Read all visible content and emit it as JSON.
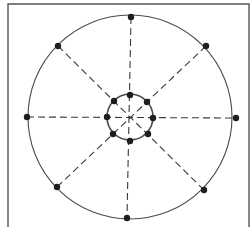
{
  "diagram": {
    "type": "two-concentric-ring network with radial spokes",
    "colors": {
      "background": "#ffffff",
      "frame": "#555555",
      "ring": "#4a4a4a",
      "spoke": "#3a3a3a",
      "node": "#1e1e1e"
    },
    "frame": {
      "x": 8,
      "y": 4,
      "width": 241,
      "height": 223
    },
    "center": {
      "x": 130,
      "y": 117
    },
    "outer_ring": {
      "radius": 102,
      "nodes": [
        {
          "id": "outer-top",
          "x": 131,
          "y": 17
        },
        {
          "id": "outer-top-right",
          "x": 206,
          "y": 46
        },
        {
          "id": "outer-right",
          "x": 236,
          "y": 118
        },
        {
          "id": "outer-bottom-right",
          "x": 204,
          "y": 190
        },
        {
          "id": "outer-bottom",
          "x": 127,
          "y": 218
        },
        {
          "id": "outer-bottom-left",
          "x": 57,
          "y": 187
        },
        {
          "id": "outer-left",
          "x": 27,
          "y": 117
        },
        {
          "id": "outer-top-left",
          "x": 58,
          "y": 46
        }
      ]
    },
    "inner_ring": {
      "radius": 23,
      "nodes": [
        {
          "id": "inner-top",
          "x": 130,
          "y": 95
        },
        {
          "id": "inner-top-right",
          "x": 147,
          "y": 102
        },
        {
          "id": "inner-right",
          "x": 153,
          "y": 118
        },
        {
          "id": "inner-bottom-right",
          "x": 148,
          "y": 134
        },
        {
          "id": "inner-bottom",
          "x": 130,
          "y": 141
        },
        {
          "id": "inner-bottom-left",
          "x": 113,
          "y": 134
        },
        {
          "id": "inner-left",
          "x": 107,
          "y": 117
        },
        {
          "id": "inner-top-left",
          "x": 114,
          "y": 101
        }
      ]
    },
    "spokes": [
      {
        "from": "outer-top",
        "to": "outer-bottom"
      },
      {
        "from": "outer-left",
        "to": "outer-right"
      },
      {
        "from": "outer-top-left",
        "to": "outer-bottom-right"
      },
      {
        "from": "outer-top-right",
        "to": "outer-bottom-left"
      }
    ],
    "spoke_style": "dashed",
    "node_radius": 3.2
  }
}
